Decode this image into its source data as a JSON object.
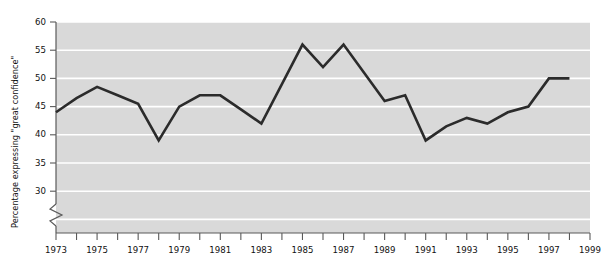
{
  "chart_data": {
    "type": "line",
    "title": "",
    "xlabel": "",
    "ylabel": "Percentage expressing  \"great confidence\"",
    "xlim": [
      1973,
      1999
    ],
    "ylim": [
      27.5,
      60
    ],
    "ylim_visible": [
      30,
      60
    ],
    "axis_break": true,
    "axis_break_note": "y-axis broken below 30",
    "grid": true,
    "grid_orientation": "horizontal",
    "legend": "none",
    "plot_background": "#d9d9d9",
    "gridline_color": "#ffffff",
    "line_color": "#2b2b2b",
    "x": [
      1973,
      1974,
      1975,
      1976,
      1977,
      1978,
      1979,
      1980,
      1981,
      1982,
      1983,
      1984,
      1985,
      1986,
      1987,
      1988,
      1989,
      1990,
      1991,
      1992,
      1993,
      1994,
      1995,
      1996,
      1997,
      1998
    ],
    "values": [
      44,
      46.5,
      48.5,
      47,
      45.5,
      39,
      45,
      47,
      47,
      44.5,
      42,
      49,
      56,
      52,
      56,
      51,
      46,
      47,
      39,
      41.5,
      43,
      42,
      44,
      45,
      50,
      50
    ],
    "series": [
      {
        "name": "Percentage expressing \"great confidence\"",
        "values": [
          44,
          46.5,
          48.5,
          47,
          45.5,
          39,
          45,
          47,
          47,
          44.5,
          42,
          49,
          56,
          52,
          56,
          51,
          46,
          47,
          39,
          41.5,
          43,
          42,
          44,
          45,
          50,
          50
        ]
      }
    ],
    "y_ticks": [
      30,
      35,
      40,
      45,
      50,
      55,
      60
    ],
    "y_tick_labels": [
      "30",
      "35",
      "40",
      "45",
      "50",
      "55",
      "60"
    ],
    "x_ticks": [
      1973,
      1974,
      1975,
      1976,
      1977,
      1978,
      1979,
      1980,
      1981,
      1982,
      1983,
      1984,
      1985,
      1986,
      1987,
      1988,
      1989,
      1990,
      1991,
      1992,
      1993,
      1994,
      1995,
      1996,
      1997,
      1998,
      1999
    ],
    "x_tick_labels_shown": [
      "1973",
      "1975",
      "1977",
      "1979",
      "1981",
      "1983",
      "1985",
      "1987",
      "1989",
      "1991",
      "1993",
      "1995",
      "1997",
      "1999"
    ]
  }
}
